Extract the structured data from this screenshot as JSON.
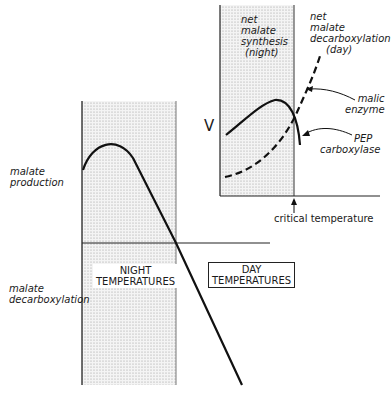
{
  "main_plot": {
    "y_labels": {
      "top": [
        "malate",
        "production"
      ],
      "bottom": [
        "malate",
        "decarboxylation"
      ]
    },
    "regions": {
      "night": [
        "NIGHT",
        "TEMPERATURES"
      ],
      "day": [
        "DAY",
        "TEMPERATURES"
      ]
    }
  },
  "inset_plot": {
    "y_axis_label": "V",
    "regions": {
      "night": [
        "net",
        "malate",
        "synthesis",
        "(night)"
      ],
      "day": [
        "net",
        "malate",
        "decarboxylation",
        "(day)"
      ]
    },
    "curves": {
      "malic_enzyme": [
        "malic",
        "enzyme"
      ],
      "pep_carboxylase": [
        "PEP",
        "carboxylase"
      ]
    },
    "marker_label": "critical temperature"
  },
  "colors": {
    "line": "#111111",
    "stipple": "#cfcfcf",
    "background": "#ffffff"
  }
}
